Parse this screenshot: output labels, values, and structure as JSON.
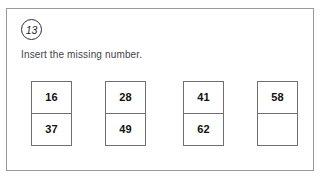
{
  "question": {
    "number": "13",
    "instruction": "Insert the missing number."
  },
  "dominoes": [
    {
      "top": "16",
      "bottom": "37"
    },
    {
      "top": "28",
      "bottom": "49"
    },
    {
      "top": "41",
      "bottom": "62"
    },
    {
      "top": "58",
      "bottom": ""
    }
  ]
}
